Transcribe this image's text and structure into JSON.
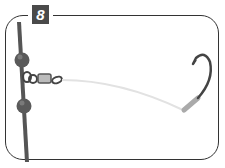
{
  "step": {
    "number": "8"
  },
  "figure": {
    "elements": [
      "main-line",
      "upper-bead",
      "lower-bead",
      "swivel",
      "leader-line",
      "hook"
    ]
  },
  "colors": {
    "frame": "#333333",
    "badge_bg": "#4a4a4a",
    "badge_text": "#ffffff",
    "line": "#555555",
    "bead": "#5a5a5a",
    "leader": "#dddddd",
    "hook": "#444444"
  }
}
